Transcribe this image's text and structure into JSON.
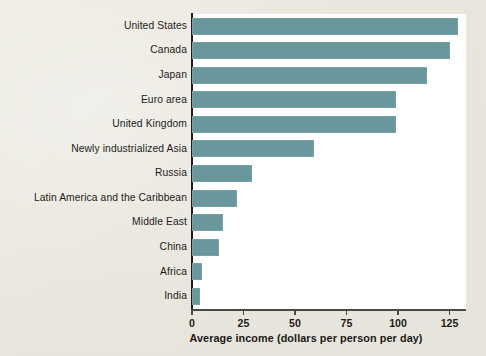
{
  "figure": {
    "background_color": "#eae7de",
    "panel_color": "#ffffff",
    "bar_color": "#6a979c",
    "axis_color": "#1d1d1b"
  },
  "chart_data": {
    "type": "bar",
    "orientation": "horizontal",
    "title": "",
    "subtitle": "",
    "xlabel": "Average income (dollars per person per day)",
    "ylabel": "",
    "xlim": [
      0,
      133
    ],
    "ylim": null,
    "grid": false,
    "legend": null,
    "xticks": [
      0,
      25,
      50,
      75,
      100,
      125
    ],
    "xticklabels": [
      "0",
      "25",
      "50",
      "75",
      "100",
      "125"
    ],
    "categories": [
      "United States",
      "Canada",
      "Japan",
      "Euro area",
      "United Kingdom",
      "Newly industrialized Asia",
      "Russia",
      "Latin America and the Caribbean",
      "Middle East",
      "China",
      "Africa",
      "India"
    ],
    "values": [
      129,
      125,
      114,
      99,
      99,
      59,
      29,
      22,
      15,
      13,
      5,
      4
    ],
    "series": [
      {
        "name": "Average income",
        "values": [
          129,
          125,
          114,
          99,
          99,
          59,
          29,
          22,
          15,
          13,
          5,
          4
        ]
      }
    ],
    "annotations": []
  }
}
